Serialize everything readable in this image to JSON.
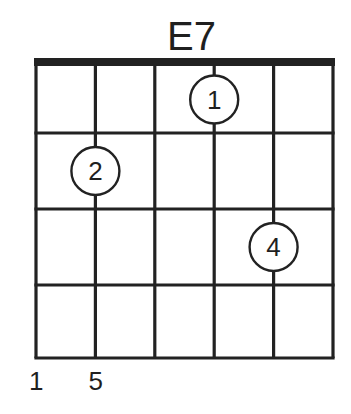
{
  "chord": {
    "name": "E7",
    "strings": 6,
    "frets": 4,
    "nut": true,
    "fingers": [
      {
        "label": "1",
        "string": 4,
        "fret": 1
      },
      {
        "label": "2",
        "string": 2,
        "fret": 2
      },
      {
        "label": "4",
        "string": 5,
        "fret": 3
      }
    ],
    "bottom_labels": [
      {
        "text": "1",
        "string": 1
      },
      {
        "text": "5",
        "string": 2
      }
    ]
  },
  "colors": {
    "line": "#222222",
    "background": "#ffffff",
    "text": "#1f1f1f"
  },
  "layout": {
    "x0": 36,
    "x1": 333,
    "nut_top": 58,
    "nut_bottom": 66,
    "fret_y": [
      66,
      133,
      209,
      285,
      358
    ],
    "circle_r": 24
  }
}
